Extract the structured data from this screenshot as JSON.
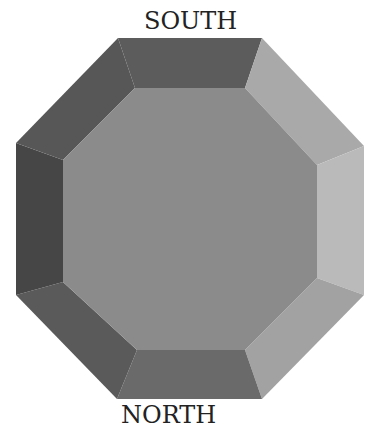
{
  "diagram": {
    "type": "octagon-bevel-orientation",
    "labels": {
      "top": "SOUTH",
      "bottom": "NORTH"
    },
    "outer_octagon": [
      [
        118,
        38
      ],
      [
        262,
        38
      ],
      [
        364,
        146
      ],
      [
        364,
        295
      ],
      [
        262,
        399
      ],
      [
        117,
        399
      ],
      [
        16,
        295
      ],
      [
        16,
        143
      ]
    ],
    "inner_octagon": [
      [
        135,
        88
      ],
      [
        245,
        88
      ],
      [
        317,
        165
      ],
      [
        317,
        278
      ],
      [
        245,
        350
      ],
      [
        137,
        350
      ],
      [
        63,
        282
      ],
      [
        63,
        160
      ]
    ],
    "colors": {
      "center": "#8b8b8b",
      "top": "#5c5c5c",
      "upper_right": "#a9a9a9",
      "right": "#bababa",
      "lower_right": "#a2a2a2",
      "bottom": "#6a6a6a",
      "lower_left": "#5a5a5a",
      "left": "#464646",
      "upper_left": "#575757"
    }
  }
}
